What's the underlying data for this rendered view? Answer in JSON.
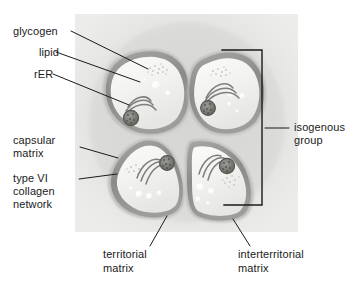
{
  "figure": {
    "background_panel_color": "#e4e4e2",
    "cell_rim_color": "#8d8d8d",
    "cytoplasm_color": "#f2f2f0",
    "nucleus_color": "#6e6e6e",
    "leader_line_color": "#1b1b1b"
  },
  "labels": {
    "glycogen": "glycogen",
    "lipid": "lipid",
    "rer": "rER",
    "capsular_matrix_line1": "capsular",
    "capsular_matrix_line2": "matrix",
    "collagen_line1": "type VI",
    "collagen_line2": "collagen",
    "collagen_line3": "network",
    "isogenous_line1": "isogenous",
    "isogenous_line2": "group",
    "territorial_line1": "territorial",
    "territorial_line2": "matrix",
    "interterritorial_line1": "interterritorial",
    "interterritorial_line2": "matrix"
  },
  "structures": {
    "cells": [
      {
        "name": "chondrocyte-top-left",
        "position": "top-left"
      },
      {
        "name": "chondrocyte-top-right",
        "position": "top-right"
      },
      {
        "name": "chondrocyte-bottom-left",
        "position": "bottom-left"
      },
      {
        "name": "chondrocyte-bottom-right",
        "position": "bottom-right"
      }
    ],
    "organelles": [
      "nucleus",
      "rough-endoplasmic-reticulum",
      "lipid-droplet",
      "glycogen-granules"
    ],
    "matrix_zones": [
      "capsular matrix",
      "territorial matrix",
      "interterritorial matrix"
    ],
    "bracket": "isogenous group"
  }
}
